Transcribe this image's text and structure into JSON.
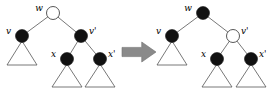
{
  "figure": {
    "name": "red-black-tree-recoloring-transformation",
    "background_color": "#ffffff",
    "width": 276,
    "height": 90
  },
  "colors": {
    "node_black_fill": "#111111",
    "node_white_fill": "#ffffff",
    "node_stroke": "#444444",
    "edge_stroke": "#555555",
    "arrow_fill": "#8a8a8a",
    "arrow_stroke": "#6e6e6e",
    "label_color": "#000000"
  },
  "arrow": {
    "label": "transforms-to",
    "glyph": "➡",
    "x": 122,
    "y": 52,
    "width": 34,
    "height": 20
  },
  "left_tree": {
    "caption": "before",
    "nodes": [
      {
        "id": "w",
        "label": "w",
        "cx": 53,
        "cy": 13,
        "r": 6.5,
        "fill": "white",
        "label_dx": -10,
        "label_dy": -2
      },
      {
        "id": "v",
        "label": "v",
        "cx": 22,
        "cy": 36,
        "r": 6.5,
        "fill": "black",
        "label_dx": -11,
        "label_dy": -2
      },
      {
        "id": "vprime",
        "label": "v'",
        "cx": 81,
        "cy": 36,
        "r": 6.5,
        "fill": "black",
        "label_dx": 8,
        "label_dy": -2
      },
      {
        "id": "x",
        "label": "x",
        "cx": 67,
        "cy": 59,
        "r": 6.5,
        "fill": "black",
        "label_dx": -11,
        "label_dy": -2
      },
      {
        "id": "xprime",
        "label": "x'",
        "cx": 100,
        "cy": 59,
        "r": 6.5,
        "fill": "black",
        "label_dx": 8,
        "label_dy": -2
      }
    ],
    "edges": [
      {
        "from": "w",
        "to": "v"
      },
      {
        "from": "w",
        "to": "vprime"
      },
      {
        "from": "vprime",
        "to": "x"
      },
      {
        "from": "vprime",
        "to": "xprime"
      }
    ],
    "subtrees": [
      {
        "id": "v-subtree",
        "apex_x": 22,
        "apex_y": 41,
        "half_width": 15,
        "height": 24
      },
      {
        "id": "x-subtree",
        "apex_x": 67,
        "apex_y": 64,
        "half_width": 15,
        "height": 23
      },
      {
        "id": "xprime-subtree",
        "apex_x": 100,
        "apex_y": 64,
        "half_width": 15,
        "height": 23
      }
    ]
  },
  "right_tree": {
    "caption": "after",
    "nodes": [
      {
        "id": "w",
        "label": "w",
        "cx": 203,
        "cy": 13,
        "r": 6.5,
        "fill": "black",
        "label_dx": -11,
        "label_dy": -2
      },
      {
        "id": "v",
        "label": "v",
        "cx": 172,
        "cy": 36,
        "r": 6.5,
        "fill": "black",
        "label_dx": -11,
        "label_dy": -2
      },
      {
        "id": "vprime",
        "label": "v'",
        "cx": 233,
        "cy": 36,
        "r": 6.5,
        "fill": "white",
        "label_dx": 8,
        "label_dy": -2
      },
      {
        "id": "x",
        "label": "x",
        "cx": 217,
        "cy": 59,
        "r": 6.5,
        "fill": "black",
        "label_dx": -11,
        "label_dy": -2
      },
      {
        "id": "xprime",
        "label": "x'",
        "cx": 251,
        "cy": 59,
        "r": 6.5,
        "fill": "black",
        "label_dx": 8,
        "label_dy": -2
      }
    ],
    "edges": [
      {
        "from": "w",
        "to": "v"
      },
      {
        "from": "w",
        "to": "vprime"
      },
      {
        "from": "vprime",
        "to": "x"
      },
      {
        "from": "vprime",
        "to": "xprime"
      }
    ],
    "subtrees": [
      {
        "id": "v-subtree",
        "apex_x": 172,
        "apex_y": 41,
        "half_width": 15,
        "height": 24
      },
      {
        "id": "x-subtree",
        "apex_x": 217,
        "apex_y": 64,
        "half_width": 15,
        "height": 23
      },
      {
        "id": "xprime-subtree",
        "apex_x": 251,
        "apex_y": 64,
        "half_width": 15,
        "height": 23
      }
    ]
  }
}
